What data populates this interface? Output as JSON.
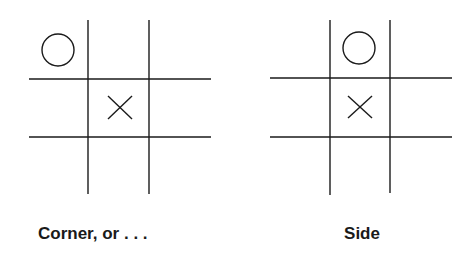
{
  "colors": {
    "ink": "#1a1a1a",
    "background": "#ffffff"
  },
  "panels": [
    {
      "caption": "Corner, or . . .",
      "board": [
        [
          "O",
          "",
          ""
        ],
        [
          "",
          "X",
          ""
        ],
        [
          "",
          "",
          ""
        ]
      ]
    },
    {
      "caption": "Side",
      "board": [
        [
          "",
          "O",
          ""
        ],
        [
          "",
          "X",
          ""
        ],
        [
          "",
          "",
          ""
        ]
      ]
    }
  ]
}
